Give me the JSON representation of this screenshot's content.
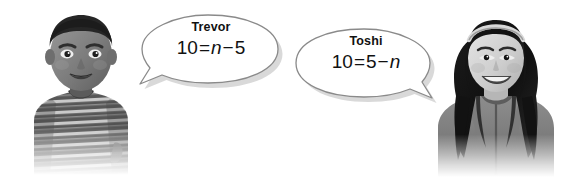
{
  "scene": {
    "width": 564,
    "height": 177,
    "background_color": "#ffffff",
    "description": "Two students with speech bubbles showing equations"
  },
  "colors": {
    "text": "#111111",
    "bubble_fill": "#ffffff",
    "bubble_stroke": "#8a8a8a",
    "bubble_shadow": "#b9b9b9",
    "photo_gray_dark": "#3a3a3a",
    "photo_gray_mid": "#8d8d8d",
    "photo_gray_light": "#cfcfcf"
  },
  "speakers": [
    {
      "id": "trevor",
      "name": "Trevor",
      "photo_alt": "photo-boy-striped-shirt",
      "bubble_tail": "left",
      "equation": {
        "full_text": "10 = n - 5",
        "tokens": [
          {
            "type": "number",
            "text": "10"
          },
          {
            "type": "operator",
            "text": "="
          },
          {
            "type": "variable",
            "text": "n"
          },
          {
            "type": "operator",
            "text": "−"
          },
          {
            "type": "number",
            "text": "5"
          }
        ]
      }
    },
    {
      "id": "toshi",
      "name": "Toshi",
      "photo_alt": "photo-girl-headband-hoodie",
      "bubble_tail": "right",
      "equation": {
        "full_text": "10 = 5 - n",
        "tokens": [
          {
            "type": "number",
            "text": "10"
          },
          {
            "type": "operator",
            "text": "="
          },
          {
            "type": "number",
            "text": "5"
          },
          {
            "type": "operator",
            "text": "−"
          },
          {
            "type": "variable",
            "text": "n"
          }
        ]
      }
    }
  ]
}
